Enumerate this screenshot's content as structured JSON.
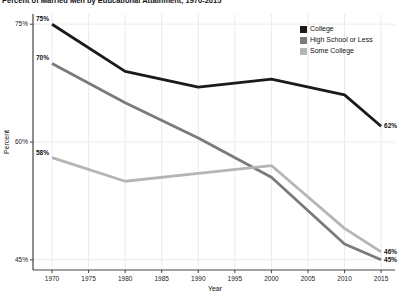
{
  "title": "Percent of Married Men by Educational Attainment, 1970-2015",
  "legend": {
    "items": [
      {
        "label": "College",
        "color": "#1a1a1a"
      },
      {
        "label": "High School or Less",
        "color": "#7a7a7a"
      },
      {
        "label": "Some College",
        "color": "#b5b5b5"
      }
    ]
  },
  "chart_data": {
    "type": "line",
    "x": [
      1970,
      1980,
      1990,
      2000,
      2010,
      2015
    ],
    "series": [
      {
        "name": "College",
        "color": "#1a1a1a",
        "values": [
          75,
          69,
          67,
          68,
          66,
          62
        ],
        "start_label": "75%",
        "end_label": "62%"
      },
      {
        "name": "High School or Less",
        "color": "#7a7a7a",
        "values": [
          70,
          65,
          60.5,
          55.5,
          47,
          45
        ],
        "start_label": "70%",
        "end_label": "45%"
      },
      {
        "name": "Some College",
        "color": "#b5b5b5",
        "values": [
          58,
          55,
          56,
          57,
          49,
          46
        ],
        "start_label": "58%",
        "end_label": "46%"
      }
    ],
    "xlabel": "Year",
    "ylabel": "Percent",
    "x_ticks": [
      1970,
      1975,
      1980,
      1985,
      1990,
      1995,
      2000,
      2005,
      2010,
      2015
    ],
    "y_ticks": [
      {
        "value": 45,
        "label": "45%"
      },
      {
        "value": 60,
        "label": "60%"
      },
      {
        "value": 75,
        "label": "75%"
      }
    ],
    "xlim": [
      1967.4,
      2016.9
    ],
    "ylim": [
      43.7,
      76.3
    ],
    "grid": true,
    "legend_position": "top-right",
    "colors": {
      "axis": "#444444",
      "grid": "#ebebeb",
      "tick_text": "#222222"
    }
  }
}
